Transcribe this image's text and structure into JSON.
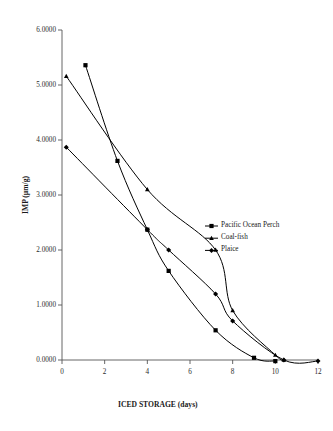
{
  "chart_data": {
    "type": "line",
    "title": "",
    "xlabel": "ICED STORAGE (days)",
    "ylabel": "IMP (µm/g)",
    "xlim": [
      0,
      12
    ],
    "ylim": [
      0,
      6
    ],
    "xticks": [
      "0",
      "2",
      "4",
      "6",
      "8",
      "10",
      "12"
    ],
    "xtick_values": [
      0,
      2,
      4,
      6,
      8,
      10,
      12
    ],
    "yticks": [
      "0.0000",
      "1.0000",
      "2.0000",
      "3.0000",
      "4.0000",
      "5.0000",
      "6.0000"
    ],
    "ytick_values": [
      0,
      1,
      2,
      3,
      4,
      5,
      6
    ],
    "grid": false,
    "legend_position": "center-right",
    "series": [
      {
        "name": "Pacific Ocean Perch",
        "marker": "square",
        "color": "#000000",
        "points": [
          {
            "x": 1.1,
            "y": 5.36
          },
          {
            "x": 2.6,
            "y": 3.62
          },
          {
            "x": 4.0,
            "y": 2.37
          },
          {
            "x": 5.0,
            "y": 1.62
          },
          {
            "x": 7.2,
            "y": 0.54
          },
          {
            "x": 9.0,
            "y": 0.04
          },
          {
            "x": 10.0,
            "y": -0.02
          }
        ]
      },
      {
        "name": "Coal-fish",
        "marker": "triangle",
        "color": "#000000",
        "points": [
          {
            "x": 0.2,
            "y": 5.16
          },
          {
            "x": 4.0,
            "y": 3.1
          },
          {
            "x": 7.2,
            "y": 2.0
          },
          {
            "x": 8.0,
            "y": 0.9
          },
          {
            "x": 10.0,
            "y": 0.09
          },
          {
            "x": 10.4,
            "y": 0.0
          }
        ]
      },
      {
        "name": "Plaice",
        "marker": "cross",
        "color": "#000000",
        "points": [
          {
            "x": 0.2,
            "y": 3.87
          },
          {
            "x": 4.0,
            "y": 2.37
          },
          {
            "x": 5.0,
            "y": 2.0
          },
          {
            "x": 7.2,
            "y": 1.2
          },
          {
            "x": 8.0,
            "y": 0.71
          },
          {
            "x": 10.4,
            "y": 0.0
          },
          {
            "x": 12.0,
            "y": -0.02
          }
        ]
      }
    ]
  },
  "legend": {
    "entries": [
      {
        "label": "Pacific Ocean Perch"
      },
      {
        "label": "Coal-fish"
      },
      {
        "label": "Plaice"
      }
    ]
  }
}
